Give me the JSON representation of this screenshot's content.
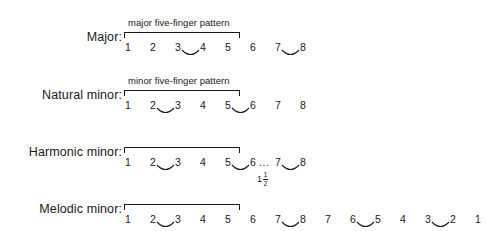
{
  "figure": {
    "background_color": "#ffffff",
    "ink_color": "#1a1a1a"
  },
  "rows": [
    {
      "id": "major",
      "label": "Major:",
      "caption": "major five-finger pattern",
      "has_bracket": true,
      "degrees": [
        "1",
        "2",
        "3",
        "4",
        "5",
        "6",
        "7",
        "8"
      ],
      "slurs": [
        {
          "from_index": 2,
          "to_index": 3
        },
        {
          "from_index": 6,
          "to_index": 7
        }
      ],
      "gap": null,
      "interval_label": null
    },
    {
      "id": "natural-minor",
      "label": "Natural minor:",
      "caption": "minor five-finger pattern",
      "has_bracket": true,
      "degrees": [
        "1",
        "2",
        "3",
        "4",
        "5",
        "6",
        "7",
        "8"
      ],
      "slurs": [
        {
          "from_index": 1,
          "to_index": 2
        },
        {
          "from_index": 4,
          "to_index": 5
        }
      ],
      "gap": null,
      "interval_label": null
    },
    {
      "id": "harmonic-minor",
      "label": "Harmonic minor:",
      "caption": "",
      "has_bracket": true,
      "degrees": [
        "1",
        "2",
        "3",
        "4",
        "5",
        "6",
        "7",
        "8"
      ],
      "slurs": [
        {
          "from_index": 1,
          "to_index": 2
        },
        {
          "from_index": 4,
          "to_index": 5
        },
        {
          "from_index": 6,
          "to_index": 7
        }
      ],
      "gap": {
        "after_index": 5,
        "dots": "..."
      },
      "interval_label": {
        "whole": "1",
        "numerator": "1",
        "denominator": "2",
        "after_index": 5
      }
    },
    {
      "id": "melodic-minor",
      "label": "Melodic minor:",
      "caption": "",
      "has_bracket": true,
      "degrees": [
        "1",
        "2",
        "3",
        "4",
        "5",
        "6",
        "7",
        "8",
        "7",
        "6",
        "5",
        "4",
        "3",
        "2",
        "1"
      ],
      "slurs": [
        {
          "from_index": 1,
          "to_index": 2
        },
        {
          "from_index": 6,
          "to_index": 7
        },
        {
          "from_index": 9,
          "to_index": 10
        },
        {
          "from_index": 12,
          "to_index": 13
        }
      ],
      "gap": null,
      "interval_label": null
    }
  ],
  "layout": {
    "degree_start_x": 128,
    "degree_step_x": 25,
    "row_tops": [
      18,
      76,
      133,
      190
    ]
  }
}
